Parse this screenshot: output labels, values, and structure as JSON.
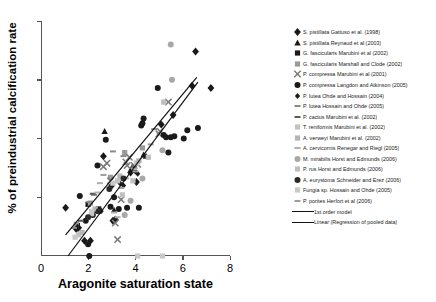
{
  "chart_data": {
    "type": "scatter",
    "title": "",
    "xlabel": "Aragonite saturation state",
    "ylabel": "% of preindustrial calcification rate",
    "xlim": [
      0,
      8
    ],
    "ylim": [
      0,
      200
    ],
    "xticks": [
      0,
      2,
      4,
      6,
      8
    ],
    "yticks": [
      0,
      50,
      100,
      150,
      200
    ],
    "grid": false,
    "legend_position": "right",
    "series": [
      {
        "name": "S. pistillata Gattuso et al. (1998)",
        "marker": "diamond",
        "color": "#1a1a1a",
        "points": [
          [
            1.0,
            41
          ],
          [
            1.45,
            23
          ],
          [
            1.55,
            24
          ],
          [
            1.8,
            13
          ],
          [
            2.05,
            13
          ],
          [
            2.3,
            39
          ],
          [
            2.45,
            39
          ],
          [
            2.6,
            85
          ],
          [
            2.95,
            60
          ],
          [
            3.0,
            30
          ],
          [
            3.1,
            31
          ],
          [
            3.75,
            71
          ],
          [
            3.8,
            73
          ],
          [
            4.0,
            63
          ],
          [
            5.05,
            112
          ],
          [
            5.55,
            120
          ],
          [
            6.35,
            145
          ],
          [
            7.15,
            143
          ],
          [
            6.5,
            174
          ]
        ]
      },
      {
        "name": "S. pistillata Reynaud et al (2003)",
        "marker": "triangle",
        "color": "#1a1a1a",
        "points": [
          [
            2.65,
            106
          ],
          [
            3.05,
            39
          ],
          [
            4.3,
            86
          ],
          [
            4.4,
            85
          ]
        ]
      },
      {
        "name": "G. fascicularis Marubini et al (2002)",
        "marker": "square",
        "color": "#1a1a1a",
        "points": [
          [
            1.5,
            26
          ],
          [
            1.95,
            44
          ],
          [
            2.4,
            40
          ],
          [
            3.85,
            74
          ]
        ]
      },
      {
        "name": "G. fascicularis Marshall and Clode (2002)",
        "marker": "square",
        "color": "#9a9a9a",
        "points": [
          [
            1.45,
            27
          ],
          [
            2.05,
            45
          ],
          [
            2.9,
            67
          ],
          [
            3.5,
            88
          ],
          [
            4.25,
            92
          ]
        ]
      },
      {
        "name": "P. compressa Marubini et al (2001)",
        "marker": "x",
        "color": "#7a7a7a",
        "points": [
          [
            2.6,
            76
          ],
          [
            2.75,
            79
          ],
          [
            2.9,
            64
          ],
          [
            3.1,
            28
          ],
          [
            3.2,
            14
          ],
          [
            3.35,
            48
          ],
          [
            3.55,
            80
          ],
          [
            3.6,
            77
          ],
          [
            3.7,
            84
          ],
          [
            3.9,
            77
          ],
          [
            4.05,
            78
          ],
          [
            4.95,
            104
          ],
          [
            5.0,
            106
          ],
          [
            5.35,
            131
          ]
        ]
      },
      {
        "name": "P. compressa Langdon and Atkinson (2005)",
        "marker": "circle",
        "color": "#1a1a1a",
        "points": [
          [
            1.6,
            51
          ],
          [
            1.85,
            30
          ],
          [
            1.95,
            10
          ],
          [
            2.0,
            0
          ],
          [
            2.15,
            35
          ],
          [
            2.35,
            77
          ],
          [
            2.7,
            99
          ],
          [
            2.9,
            42
          ],
          [
            3.05,
            50
          ],
          [
            3.25,
            40
          ],
          [
            3.6,
            41
          ],
          [
            4.1,
            41
          ],
          [
            4.2,
            111
          ],
          [
            4.25,
            113
          ],
          [
            4.3,
            117
          ],
          [
            4.9,
            143
          ],
          [
            5.15,
            103
          ],
          [
            5.25,
            101
          ],
          [
            5.35,
            88
          ],
          [
            5.45,
            101
          ],
          [
            5.6,
            102
          ],
          [
            6.0,
            100
          ],
          [
            6.15,
            107
          ],
          [
            6.6,
            109
          ]
        ]
      },
      {
        "name": "P. lutea Ohde and Hossain (2004)",
        "marker": "diamond-small",
        "color": "#1a1a1a",
        "points": [
          [
            1.5,
            25
          ],
          [
            2.25,
            39
          ],
          [
            2.5,
            38
          ],
          [
            3.3,
            62
          ],
          [
            3.45,
            60
          ],
          [
            3.95,
            72
          ],
          [
            4.05,
            70
          ]
        ]
      },
      {
        "name": "P. lutea Hossain and Ohde (2005)",
        "marker": "dash",
        "color": "#8a8a8a",
        "points": [
          [
            1.35,
            24
          ],
          [
            2.0,
            46
          ],
          [
            2.2,
            52
          ],
          [
            3.0,
            89
          ],
          [
            3.45,
            85
          ],
          [
            4.75,
            108
          ]
        ]
      },
      {
        "name": "P. cactus Marubini et al. (2002)",
        "marker": "dash",
        "color": "#5a5a5a",
        "points": [
          [
            1.65,
            30
          ],
          [
            2.15,
            53
          ],
          [
            3.15,
            63
          ],
          [
            3.9,
            77
          ]
        ]
      },
      {
        "name": "T. reniformis Marubini et al. (2002)",
        "marker": "square-light",
        "color": "#c2c2c2",
        "points": [
          [
            1.55,
            18
          ],
          [
            2.1,
            36
          ],
          [
            3.2,
            64
          ],
          [
            4.0,
            79
          ]
        ]
      },
      {
        "name": "A. verweyi Marubini et al. (2002)",
        "marker": "square-light",
        "color": "#b5b5b5",
        "points": [
          [
            1.7,
            20
          ],
          [
            2.25,
            40
          ],
          [
            3.3,
            68
          ],
          [
            4.1,
            81
          ]
        ]
      },
      {
        "name": "A. cervicornis Renegar and Riegl (2005)",
        "marker": "dash-light",
        "color": "#b0b0b0",
        "points": [
          [
            2.35,
            54
          ],
          [
            2.45,
            62
          ],
          [
            3.05,
            37
          ],
          [
            3.2,
            33
          ],
          [
            3.55,
            66
          ],
          [
            3.9,
            74
          ]
        ]
      },
      {
        "name": "M. mirabilis Horst and Edmunds (2006)",
        "marker": "circle-light",
        "color": "#a8a8a8",
        "points": [
          [
            3.5,
            35
          ],
          [
            3.75,
            47
          ],
          [
            4.25,
            66
          ],
          [
            5.1,
            90
          ],
          [
            5.45,
            180
          ],
          [
            5.5,
            150
          ]
        ]
      },
      {
        "name": "P. rus Horst and Edmunds (2006)",
        "marker": "square-light",
        "color": "#bfbfbf",
        "points": [
          [
            3.4,
            52
          ],
          [
            3.85,
            64
          ],
          [
            4.5,
            84
          ],
          [
            5.15,
            131
          ]
        ]
      },
      {
        "name": "A. eurystoma Schneider and Erez (2006)",
        "marker": "circle",
        "color": "#2a2a2a",
        "points": [
          [
            1.95,
            33
          ],
          [
            2.4,
            38
          ],
          [
            2.85,
            57
          ],
          [
            3.45,
            66
          ]
        ]
      },
      {
        "name": "Fungia sp. Hossain and Ohde (2005)",
        "marker": "square-light",
        "color": "#c8c8c8",
        "points": [
          [
            1.4,
            16
          ],
          [
            2.1,
            38
          ],
          [
            3.0,
            62
          ],
          [
            4.05,
            0
          ],
          [
            5.1,
            0
          ]
        ]
      },
      {
        "name": "P. porites Herfort et al (2006)",
        "marker": "dash",
        "color": "#9e9e9e",
        "points": [
          [
            2.6,
            69
          ],
          [
            3.35,
            58
          ],
          [
            3.95,
            72
          ],
          [
            4.6,
            95
          ]
        ]
      }
    ],
    "trend_lines": [
      {
        "name": "1st order model",
        "color": "#111111",
        "x": [
          1.0,
          6.55
        ],
        "y": [
          18,
          152
        ]
      },
      {
        "name": "Linear (Regression of pooled data)",
        "color": "#111111",
        "x": [
          1.1,
          6.6
        ],
        "y": [
          0,
          148
        ]
      }
    ]
  },
  "axes": {
    "ylabel": "% of preindustrial calcification rate",
    "xlabel": "Aragonite saturation state",
    "yticks": [
      "200",
      "150",
      "100",
      "50",
      "0"
    ],
    "xticks": [
      "0",
      "2",
      "4",
      "6",
      "8"
    ]
  },
  "legend": {
    "entries": [
      {
        "label": "S. pistillata Gattuso et al. (1998)",
        "marker": "diamond",
        "color": "#1a1a1a"
      },
      {
        "label": "S. pistillata Reynaud et al (2003)",
        "marker": "triangle",
        "color": "#1a1a1a"
      },
      {
        "label": "G. fascicularis Marubini et al (2002)",
        "marker": "square",
        "color": "#1a1a1a"
      },
      {
        "label": "G. fascicularis Marshall and Clode (2002)",
        "marker": "square",
        "color": "#9a9a9a"
      },
      {
        "label": "P. compressa Marubini et al (2001)",
        "marker": "x",
        "color": "#7a7a7a"
      },
      {
        "label": "P. compressa Langdon and Atkinson (2005)",
        "marker": "circle",
        "color": "#1a1a1a"
      },
      {
        "label": "P. lutea Ohde and Hossain (2004)",
        "marker": "diamond-small",
        "color": "#1a1a1a"
      },
      {
        "label": "P. lutea Hossain and Ohde (2005)",
        "marker": "dash",
        "color": "#8a8a8a"
      },
      {
        "label": "P. cactus Marubini et al. (2002)",
        "marker": "dash",
        "color": "#5a5a5a"
      },
      {
        "label": "T. reniformis Marubini et al. (2002)",
        "marker": "square-light",
        "color": "#c2c2c2"
      },
      {
        "label": "A. verweyi Marubini et al. (2002)",
        "marker": "square-light",
        "color": "#b5b5b5"
      },
      {
        "label": "A. cervicornis Renegar and Riegl (2005)",
        "marker": "dash-light",
        "color": "#b0b0b0"
      },
      {
        "label": "M. mirabilis Horst and Edmunds (2006)",
        "marker": "circle-light",
        "color": "#a8a8a8"
      },
      {
        "label": "P. rus Horst and Edmunds (2006)",
        "marker": "square-light",
        "color": "#bfbfbf"
      },
      {
        "label": "A. eurystoma Schneider and Erez (2006)",
        "marker": "circle",
        "color": "#2a2a2a"
      },
      {
        "label": "Fungia sp. Hossain and Ohde (2005)",
        "marker": "square-light",
        "color": "#c8c8c8"
      },
      {
        "label": "P. porites Herfort et al (2006)",
        "marker": "dash",
        "color": "#9e9e9e"
      }
    ],
    "line_entries": [
      {
        "label": "1st order model",
        "color": "#111111"
      },
      {
        "label": "Linear (Regression of pooled data)",
        "color": "#111111"
      }
    ]
  }
}
